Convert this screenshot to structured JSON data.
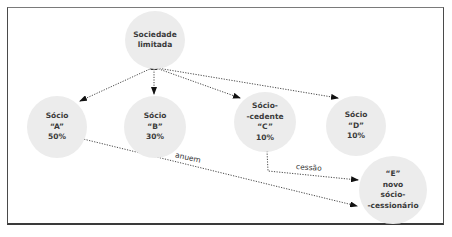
{
  "diagram": {
    "nodes": {
      "root": {
        "lines": [
          "Sociedade",
          "limitada"
        ]
      },
      "a": {
        "lines": [
          "Sócio",
          "“A”",
          "50%"
        ]
      },
      "b": {
        "lines": [
          "Sócio",
          "“B”",
          "30%"
        ]
      },
      "c": {
        "lines": [
          "Sócio-",
          "-cedente",
          "“C”",
          "10%"
        ]
      },
      "d": {
        "lines": [
          "Sócio",
          "“D”",
          "10%"
        ]
      },
      "e": {
        "lines": [
          "“E”",
          "novo",
          "sócio-",
          "-cessionário"
        ]
      }
    },
    "edges": [
      {
        "from": "root",
        "to": "a",
        "style": "dotted-arrow"
      },
      {
        "from": "root",
        "to": "b",
        "style": "dotted-arrow"
      },
      {
        "from": "root",
        "to": "c",
        "style": "dotted-arrow"
      },
      {
        "from": "root",
        "to": "d",
        "style": "dotted-arrow"
      },
      {
        "from": "c",
        "to": "e",
        "style": "dotted-arrow",
        "label": "cessão"
      },
      {
        "from": "a",
        "to": "e",
        "style": "dotted-arrow",
        "label": "anuem"
      }
    ],
    "labels": {
      "cessao": "cessão",
      "anuem": "anuem"
    },
    "colors": {
      "node_fill": "#ececec",
      "text": "#3a3a3a",
      "line": "#222222",
      "frame": "#4a4a4a"
    }
  }
}
